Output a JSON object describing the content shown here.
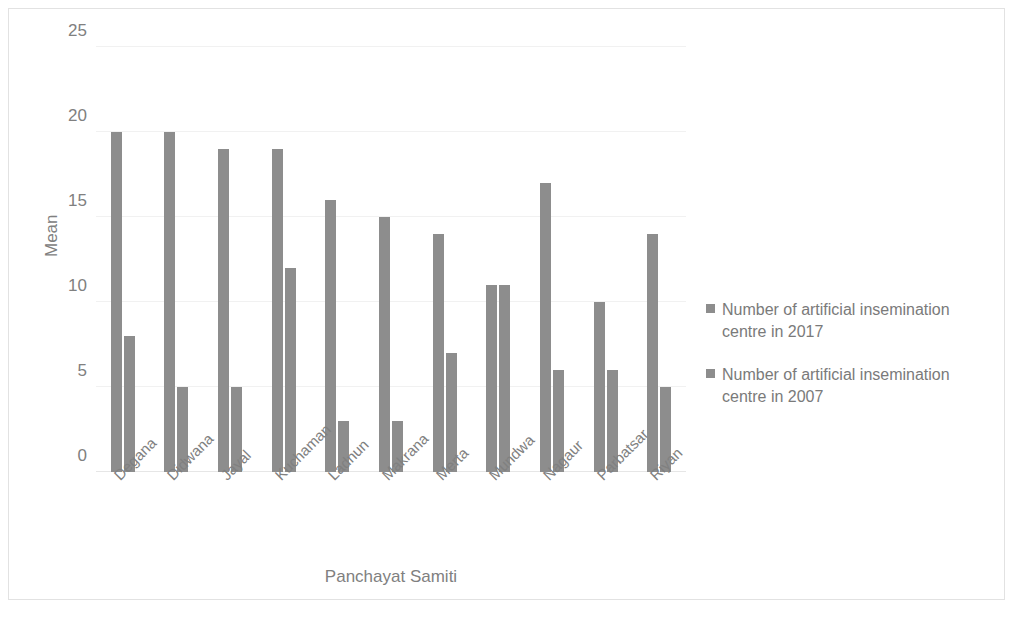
{
  "chart_data": {
    "type": "bar",
    "title": "",
    "subtitle": "",
    "xlabel": "Panchayat Samiti",
    "ylabel": "Mean",
    "ylim": [
      0,
      25
    ],
    "ytick_labels": [
      "0",
      "5",
      "10",
      "15",
      "20",
      "25"
    ],
    "ytick_values": [
      0,
      5,
      10,
      15,
      20,
      25
    ],
    "grid": true,
    "legend_position": "right",
    "bar_color": "#8d8d8d",
    "categories": [
      "Degana",
      "Didwana",
      "Jayal",
      "Kuchaman",
      "Ladnun",
      "Makrana",
      "Merta",
      "Mundwa",
      "Nagaur",
      "Parbatsar",
      "Riyan"
    ],
    "series": [
      {
        "name": "Number of artificial insemination centre in 2017",
        "values": [
          20,
          20,
          19,
          19,
          16,
          15,
          14,
          11,
          17,
          10,
          14
        ]
      },
      {
        "name": "Number of artificial insemination centre in 2007",
        "values": [
          8,
          5,
          5,
          12,
          3,
          3,
          7,
          11,
          6,
          6,
          5
        ]
      }
    ]
  }
}
